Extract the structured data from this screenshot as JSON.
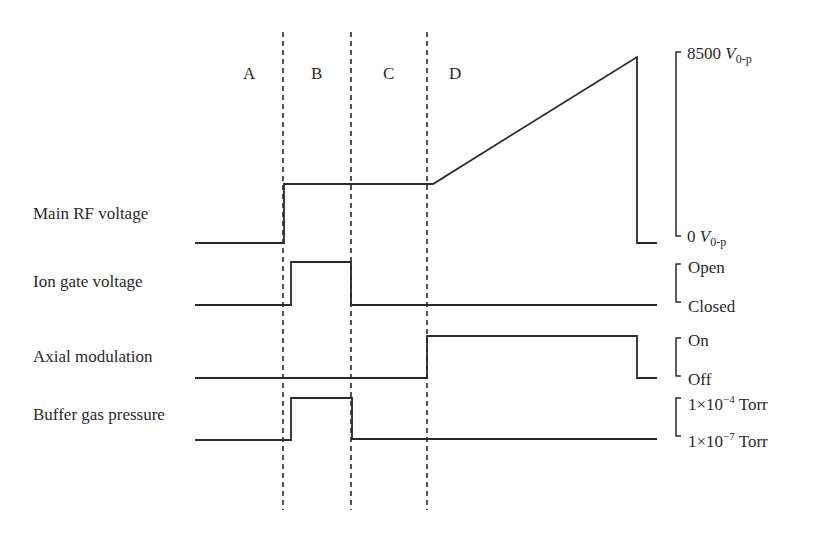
{
  "diagram": {
    "type": "timing-diagram",
    "phases": [
      {
        "label": "A"
      },
      {
        "label": "B"
      },
      {
        "label": "C"
      },
      {
        "label": "D"
      }
    ],
    "signals": [
      {
        "name": "Main RF voltage",
        "high_label_num": "8500",
        "high_label_sym": "V",
        "high_label_sub": "0-p",
        "low_label_num": "0",
        "low_label_sym": "V",
        "low_label_sub": "0-p"
      },
      {
        "name": "Ion gate voltage",
        "high_label": "Open",
        "low_label": "Closed"
      },
      {
        "name": "Axial modulation",
        "high_label": "On",
        "low_label": "Off"
      },
      {
        "name": "Buffer gas pressure",
        "high_label_base": "1×10",
        "high_label_exp": "−4",
        "high_label_unit": " Torr",
        "low_label_base": "1×10",
        "low_label_exp": "−7",
        "low_label_unit": " Torr"
      }
    ],
    "colors": {
      "line": "#2a2a2a",
      "background": "#ffffff"
    }
  }
}
